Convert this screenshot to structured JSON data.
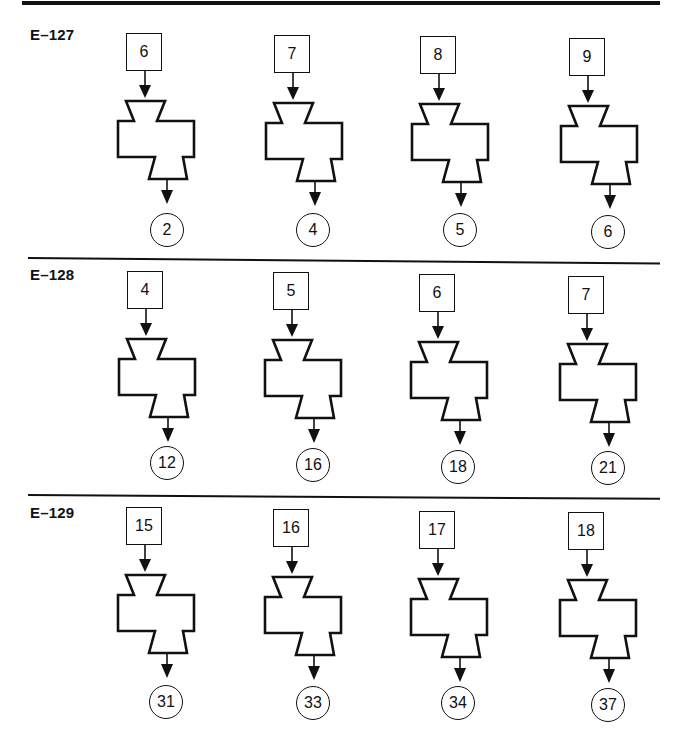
{
  "colors": {
    "ink": "#111111",
    "background": "#ffffff"
  },
  "sections": [
    {
      "label": "E–127",
      "machines": [
        {
          "input": "6",
          "output": "2"
        },
        {
          "input": "7",
          "output": "4"
        },
        {
          "input": "8",
          "output": "5"
        },
        {
          "input": "9",
          "output": "6"
        }
      ]
    },
    {
      "label": "E–128",
      "machines": [
        {
          "input": "4",
          "output": "12"
        },
        {
          "input": "5",
          "output": "16"
        },
        {
          "input": "6",
          "output": "18"
        },
        {
          "input": "7",
          "output": "21"
        }
      ]
    },
    {
      "label": "E–129",
      "machines": [
        {
          "input": "15",
          "output": "31"
        },
        {
          "input": "16",
          "output": "33"
        },
        {
          "input": "17",
          "output": "34"
        },
        {
          "input": "18",
          "output": "37"
        }
      ]
    }
  ]
}
